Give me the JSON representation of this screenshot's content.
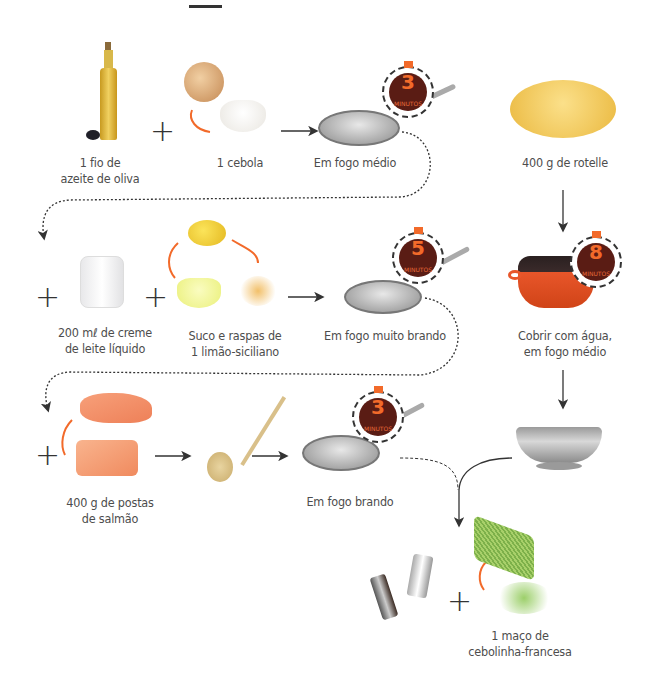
{
  "diagram": {
    "type": "recipe-flow",
    "colors": {
      "arrow": "#333333",
      "accent": "#f26a2a",
      "timer_face": "#5a1c14",
      "text": "#4d4d4d"
    },
    "steps": [
      {
        "id": "oil",
        "label_lines": [
          "1 fio de",
          "azeite de oliva"
        ],
        "icon": "olive-oil-bottle-icon"
      },
      {
        "id": "onion",
        "label_lines": [
          "1 cebola"
        ],
        "icon": "onion-icon"
      },
      {
        "id": "pan1",
        "label_lines": [
          "Em fogo médio"
        ],
        "icon": "frying-pan-icon",
        "timer": {
          "value": "3",
          "unit": "MINUTOS"
        }
      },
      {
        "id": "pasta",
        "label_lines": [
          "400 g de rotelle"
        ],
        "icon": "rotelle-pasta-icon"
      },
      {
        "id": "cream",
        "label_lines": [
          "200 mℓ de creme",
          "de leite líquido"
        ],
        "icon": "cream-jar-icon"
      },
      {
        "id": "lemon",
        "label_lines": [
          "Suco e raspas de",
          "1 limão-siciliano"
        ],
        "icon": "lemon-icon"
      },
      {
        "id": "pan2",
        "label_lines": [
          "Em fogo muito brando"
        ],
        "icon": "frying-pan-icon",
        "timer": {
          "value": "5",
          "unit": "MINUTOS"
        }
      },
      {
        "id": "pot",
        "label_lines": [
          "Cobrir com água,",
          "em fogo médio"
        ],
        "icon": "cooking-pot-icon",
        "timer": {
          "value": "8",
          "unit": "MINUTOS"
        }
      },
      {
        "id": "salmon",
        "label_lines": [
          "400 g de postas",
          "de salmão"
        ],
        "icon": "salmon-icon"
      },
      {
        "id": "spoon",
        "label_lines": [],
        "icon": "wooden-spoon-icon"
      },
      {
        "id": "pan3",
        "label_lines": [
          "Em fogo brando"
        ],
        "icon": "frying-pan-icon",
        "timer": {
          "value": "3",
          "unit": "MINUTOS"
        }
      },
      {
        "id": "colander",
        "label_lines": [],
        "icon": "colander-icon"
      },
      {
        "id": "seasoning",
        "label_lines": [],
        "icon": "salt-pepper-grinder-icon"
      },
      {
        "id": "chives",
        "label_lines": [
          "1 maço de",
          "cebolinha-francesa"
        ],
        "icon": "chives-icon"
      }
    ],
    "operators": {
      "plus": "+"
    }
  }
}
